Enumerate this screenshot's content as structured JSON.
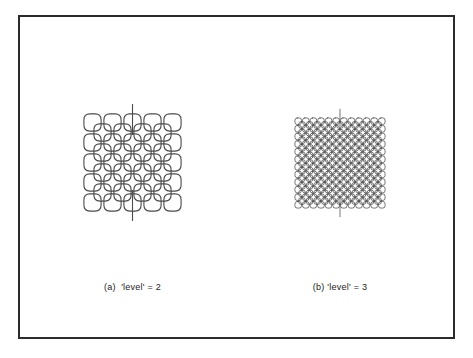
{
  "figure": {
    "background_color": "#ffffff",
    "frame_color": "#2b2b2b",
    "stroke_color": "#4a4a4a",
    "caption_color": "#1a1a1a"
  },
  "panels": [
    {
      "id": "a",
      "caption": "(a)  'level' = 2",
      "label": "(a)",
      "variable": "'level'",
      "value": "2",
      "curve": {
        "type": "diagonal-rounded-square-space-filling-curve",
        "level": 2,
        "order": 4,
        "cell_size": 20,
        "corner_radius": 6,
        "stroke_width": 1.1,
        "tail_length": 18,
        "has_top_tail": true,
        "has_bottom_tail": true,
        "width": 175,
        "height": 175
      }
    },
    {
      "id": "b",
      "caption": "(b) 'level' = 3",
      "label": "(b)",
      "variable": "'level'",
      "value": "3",
      "curve": {
        "type": "diagonal-rounded-square-space-filling-curve",
        "level": 3,
        "order": 11,
        "cell_size": 7.6,
        "corner_radius": 2.3,
        "stroke_width": 0.75,
        "tail_length": 12,
        "has_top_tail": true,
        "has_bottom_tail": true,
        "width": 180,
        "height": 180
      }
    }
  ],
  "chart_data": {
    "type": "diagram",
    "title": "",
    "series": [
      {
        "name": "(a)  'level' = 2",
        "level": 2,
        "rings": 4
      },
      {
        "name": "(b) 'level' = 3",
        "level": 3,
        "rings": 11
      }
    ]
  }
}
